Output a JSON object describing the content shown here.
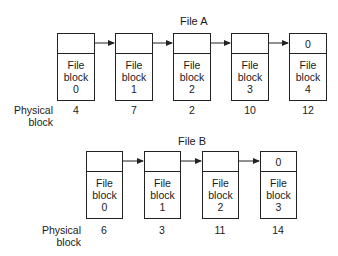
{
  "fileA": {
    "title": "File A",
    "physical_label_1": "Physical",
    "physical_label_2": "block",
    "blocks": [
      {
        "ptr": "",
        "line1": "File",
        "line2": "block",
        "index": "0",
        "physical": "4"
      },
      {
        "ptr": "",
        "line1": "File",
        "line2": "block",
        "index": "1",
        "physical": "7"
      },
      {
        "ptr": "",
        "line1": "File",
        "line2": "block",
        "index": "2",
        "physical": "2"
      },
      {
        "ptr": "",
        "line1": "File",
        "line2": "block",
        "index": "3",
        "physical": "10"
      },
      {
        "ptr": "0",
        "line1": "File",
        "line2": "block",
        "index": "4",
        "physical": "12"
      }
    ]
  },
  "fileB": {
    "title": "File B",
    "physical_label_1": "Physical",
    "physical_label_2": "block",
    "blocks": [
      {
        "ptr": "",
        "line1": "File",
        "line2": "block",
        "index": "0",
        "physical": "6"
      },
      {
        "ptr": "",
        "line1": "File",
        "line2": "block",
        "index": "1",
        "physical": "3"
      },
      {
        "ptr": "",
        "line1": "File",
        "line2": "block",
        "index": "2",
        "physical": "11"
      },
      {
        "ptr": "0",
        "line1": "File",
        "line2": "block",
        "index": "3",
        "physical": "14"
      }
    ]
  }
}
